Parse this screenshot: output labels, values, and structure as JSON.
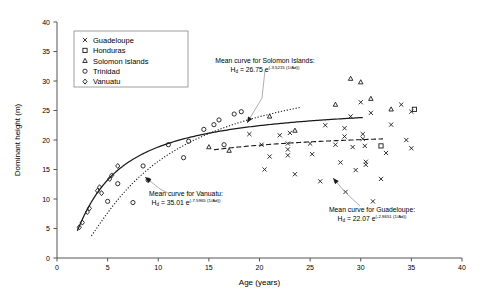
{
  "chart_data": {
    "type": "scatter",
    "title": "",
    "xlabel": "Age (years)",
    "ylabel": "Dominant height (m)",
    "xlim": [
      0,
      40
    ],
    "ylim": [
      0,
      40
    ],
    "xticks": [
      0,
      5,
      10,
      15,
      20,
      25,
      30,
      35,
      40
    ],
    "yticks": [
      0,
      5,
      10,
      15,
      20,
      25,
      30,
      35,
      40
    ],
    "grid": false,
    "legend_position": "upper-left",
    "legend_entries": [
      {
        "label": "Guadeloupe",
        "marker": "cross"
      },
      {
        "label": "Honduras",
        "marker": "square"
      },
      {
        "label": "Solomon Islands",
        "marker": "triangle"
      },
      {
        "label": "Trinidad",
        "marker": "circle"
      },
      {
        "label": "Vanuatu",
        "marker": "diamond"
      }
    ],
    "series": [
      {
        "name": "Guadeloupe",
        "marker": "cross",
        "points": [
          [
            19.0,
            21.0
          ],
          [
            20.2,
            19.2
          ],
          [
            20.5,
            15.0
          ],
          [
            21.0,
            17.2
          ],
          [
            22.0,
            20.8
          ],
          [
            22.8,
            19.4
          ],
          [
            22.8,
            18.4
          ],
          [
            22.8,
            17.4
          ],
          [
            23.0,
            21.2
          ],
          [
            23.5,
            14.2
          ],
          [
            25.0,
            19.4
          ],
          [
            25.2,
            17.6
          ],
          [
            26.0,
            13.0
          ],
          [
            26.5,
            22.5
          ],
          [
            27.5,
            19.2
          ],
          [
            28.0,
            16.2
          ],
          [
            28.4,
            22.0
          ],
          [
            28.4,
            20.6
          ],
          [
            28.5,
            11.2
          ],
          [
            29.0,
            24.0
          ],
          [
            29.2,
            18.8
          ],
          [
            29.5,
            14.9
          ],
          [
            30.0,
            26.4
          ],
          [
            30.2,
            21.0
          ],
          [
            30.2,
            20.2
          ],
          [
            30.4,
            19.0
          ],
          [
            30.5,
            16.3
          ],
          [
            30.5,
            15.8
          ],
          [
            31.0,
            24.6
          ],
          [
            31.2,
            9.6
          ],
          [
            32.0,
            13.4
          ],
          [
            32.5,
            17.8
          ],
          [
            33.0,
            22.6
          ],
          [
            34.0,
            26.0
          ],
          [
            34.5,
            20.0
          ],
          [
            35.0,
            24.8
          ],
          [
            35.0,
            18.6
          ]
        ]
      },
      {
        "name": "Honduras",
        "marker": "square",
        "points": [
          [
            32.0,
            19.0
          ],
          [
            35.3,
            25.2
          ]
        ]
      },
      {
        "name": "Solomon Islands",
        "marker": "triangle",
        "points": [
          [
            15.0,
            18.8
          ],
          [
            17.0,
            18.2
          ],
          [
            21.0,
            24.0
          ],
          [
            23.5,
            21.6
          ],
          [
            27.5,
            26.0
          ],
          [
            29.0,
            30.4
          ],
          [
            30.0,
            29.8
          ],
          [
            31.0,
            27.0
          ],
          [
            33.0,
            25.2
          ]
        ]
      },
      {
        "name": "Trinidad",
        "marker": "circle",
        "points": [
          [
            5.0,
            9.6
          ],
          [
            6.0,
            12.6
          ],
          [
            7.5,
            9.4
          ],
          [
            8.5,
            15.6
          ],
          [
            9.0,
            13.2
          ],
          [
            11.0,
            19.2
          ],
          [
            12.5,
            17.0
          ],
          [
            13.0,
            19.8
          ],
          [
            14.5,
            21.8
          ],
          [
            15.5,
            22.6
          ],
          [
            16.0,
            23.4
          ],
          [
            16.5,
            19.2
          ],
          [
            17.5,
            24.4
          ],
          [
            18.2,
            24.8
          ]
        ]
      },
      {
        "name": "Vanuatu",
        "marker": "diamond",
        "points": [
          [
            2.2,
            5.2
          ],
          [
            2.5,
            6.0
          ],
          [
            3.0,
            7.8
          ],
          [
            3.2,
            8.4
          ],
          [
            4.0,
            11.4
          ],
          [
            4.2,
            12.0
          ],
          [
            4.4,
            11.0
          ],
          [
            5.2,
            13.4
          ],
          [
            5.4,
            14.0
          ],
          [
            6.0,
            15.6
          ]
        ]
      }
    ],
    "curves": [
      {
        "name": "Solomon Islands mean curve",
        "style": "solid",
        "model": "Hd = a * exp(b / Ad)",
        "a": 26.75,
        "b": -3.5215,
        "x_from": 2.0,
        "x_to": 30.2
      },
      {
        "name": "Vanuatu mean curve",
        "style": "dotted",
        "model": "Hd = a * exp(b / Ad)",
        "a": 35.01,
        "b": -7.5965,
        "x_from": 3.4,
        "x_to": 24.0
      },
      {
        "name": "Guadeloupe mean curve",
        "style": "dashed",
        "model": "Hd = a * exp(b / Ad)",
        "a": 22.07,
        "b": -2.8651,
        "x_from": 15.5,
        "x_to": 32.2
      }
    ]
  },
  "annotations": {
    "solomon": {
      "line1": "Mean curve for Solomon Islands:",
      "eq_lead": "H",
      "eq_sub": "d",
      "eq_mid": " = 26.75 e",
      "eq_sup": "(-3.5215 (1/Ad))"
    },
    "vanuatu": {
      "line1": "Mean curve for Vanuatu:",
      "eq_lead": "H",
      "eq_sub": "d",
      "eq_mid": " = 35.01 e",
      "eq_sup": "(-7.5965 (1/Ad))"
    },
    "guadeloupe": {
      "line1": "Mean curve for Guadeloupe:",
      "eq_lead": "H",
      "eq_sub": "d",
      "eq_mid": " = 22.07 e",
      "eq_sup": "(-2.8651 (1/Ad))"
    }
  },
  "colors": {
    "ink": "#1a1a1a",
    "axis": "#555555",
    "leader": "#9a9a9a",
    "background": "#ffffff"
  }
}
